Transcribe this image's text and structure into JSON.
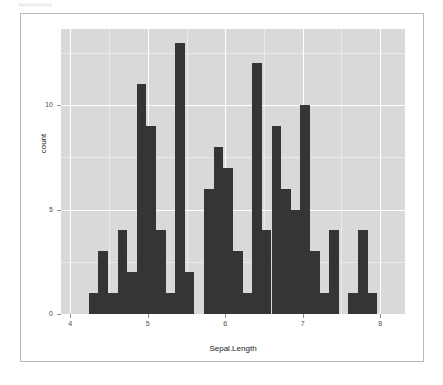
{
  "window": {
    "background_color": "#ffffff",
    "frame_border_color": "#b9b9bd"
  },
  "chart_data": {
    "type": "bar",
    "subtype": "histogram",
    "title": "",
    "subtitle": "",
    "xlabel": "Sepal.Length",
    "ylabel": "count",
    "panel_background": "#d9d9d9",
    "bar_color": "#353535",
    "gridline_color": "#ffffff",
    "grid": true,
    "legend": "none",
    "xlim": [
      3.88,
      8.32
    ],
    "ylim": [
      0,
      13.65
    ],
    "xticks": [
      4,
      5,
      6,
      7,
      8
    ],
    "xtick_labels": [
      "4",
      "5",
      "6",
      "7",
      "8"
    ],
    "x_minor_ticks": [
      4.5,
      5.5,
      6.5,
      7.5
    ],
    "yticks": [
      0,
      5,
      10
    ],
    "ytick_labels": [
      "0",
      "5",
      "10"
    ],
    "y_minor_ticks": [
      2.5,
      7.5,
      12.5
    ],
    "bins": 30,
    "binwidth": 0.124137931,
    "data_range": [
      4.3,
      7.9
    ],
    "bin_centers": [
      4.3,
      4.424,
      4.548,
      4.672,
      4.797,
      4.921,
      5.045,
      5.169,
      5.293,
      5.417,
      5.541,
      5.666,
      5.79,
      5.914,
      6.038,
      6.162,
      6.286,
      6.41,
      6.534,
      6.659,
      6.783,
      6.907,
      7.031,
      7.155,
      7.279,
      7.403,
      7.528,
      7.652,
      7.776,
      7.9
    ],
    "bin_lefts": [
      4.238,
      4.362,
      4.486,
      4.61,
      4.735,
      4.859,
      4.983,
      5.107,
      5.231,
      5.355,
      5.479,
      5.603,
      5.728,
      5.852,
      5.976,
      6.1,
      6.224,
      6.348,
      6.472,
      6.597,
      6.721,
      6.845,
      6.969,
      7.093,
      7.217,
      7.341,
      7.466,
      7.59,
      7.714,
      7.838
    ],
    "values": [
      1,
      3,
      1,
      4,
      2,
      11,
      9,
      4,
      1,
      13,
      2,
      0,
      6,
      8,
      7,
      3,
      1,
      12,
      4,
      9,
      6,
      5,
      10,
      3,
      1,
      4,
      0,
      1,
      4,
      1
    ],
    "categories": [
      "4.30",
      "4.42",
      "4.55",
      "4.67",
      "4.80",
      "4.92",
      "5.05",
      "5.17",
      "5.29",
      "5.42",
      "5.54",
      "5.67",
      "5.79",
      "5.91",
      "6.04",
      "6.16",
      "6.29",
      "6.41",
      "6.53",
      "6.66",
      "6.78",
      "6.91",
      "7.03",
      "7.16",
      "7.28",
      "7.40",
      "7.53",
      "7.65",
      "7.78",
      "7.90"
    ],
    "max_value": 13,
    "total_count": 150
  }
}
